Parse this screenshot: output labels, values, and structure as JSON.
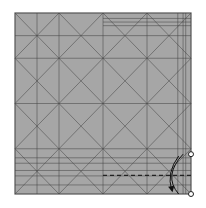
{
  "diagram": {
    "type": "origami-crease-pattern",
    "paper_color": "#a6a6a6",
    "crease_color": "#444444",
    "fold_line_style": "dashed",
    "divisions": 8,
    "markers": [
      "reference-point-top",
      "reference-point-bottom"
    ],
    "arrow": "fold-up-arrow"
  }
}
